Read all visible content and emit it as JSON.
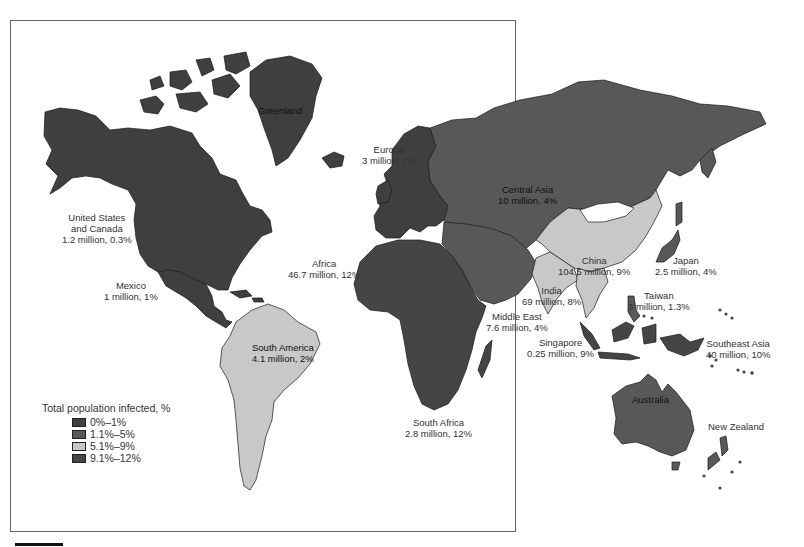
{
  "legend": {
    "title": "Total population infected, %",
    "items": [
      {
        "label": "0%–1%",
        "color": "#3f3f3f"
      },
      {
        "label": "1.1%–5%",
        "color": "#585858"
      },
      {
        "label": "5.1%–9%",
        "color": "#c8c8c8"
      },
      {
        "label": "9.1%–12%",
        "color": "#454545"
      }
    ]
  },
  "regions": {
    "greenland": {
      "name": "Greenland"
    },
    "europe": {
      "name": "Europe",
      "value": "3 million, 1%"
    },
    "central_asia": {
      "name": "Central Asia",
      "value": "10 million, 4%"
    },
    "us_canada": {
      "name_line1": "United  States",
      "name_line2": "and Canada",
      "value": "1.2 million, 0.3%"
    },
    "mexico": {
      "name": "Mexico",
      "value": "1 million, 1%"
    },
    "africa": {
      "name": "Africa",
      "value": "46.7 million, 12%"
    },
    "china": {
      "name": "China",
      "value": "104.5 million, 9%"
    },
    "japan": {
      "name": "Japan",
      "value": "2.5 million, 4%"
    },
    "india": {
      "name": "India",
      "value": "69 million, 8%"
    },
    "taiwan": {
      "name": "Taiwan",
      "value": "3 million, 1.3%"
    },
    "middle_east": {
      "name": "Middle East",
      "value": "7.6 million, 4%"
    },
    "south_america": {
      "name": "South America",
      "value": "4.1 million, 2%"
    },
    "singapore": {
      "name": "Singapore",
      "value": "0.25 million, 9%"
    },
    "southeast_asia": {
      "name": "Southeast Asia",
      "value": "40 million, 10%"
    },
    "australia": {
      "name": "Australia"
    },
    "south_africa": {
      "name": "South Africa",
      "value": "2.8 million, 12%"
    },
    "new_zealand": {
      "name": "New Zealand"
    }
  },
  "colors": {
    "low": "#3f3f3f",
    "mid": "#585858",
    "light": "#c8c8c8",
    "high": "#454545",
    "frame": "#666666",
    "ocean": "#ffffff"
  }
}
